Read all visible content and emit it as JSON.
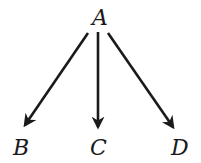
{
  "diagram": {
    "type": "tree",
    "colors": {
      "ink": "#1a1a1a",
      "background": "#ffffff"
    },
    "nodes": [
      {
        "id": "A",
        "label": "A"
      },
      {
        "id": "B",
        "label": "B"
      },
      {
        "id": "C",
        "label": "C"
      },
      {
        "id": "D",
        "label": "D"
      }
    ],
    "edges": [
      {
        "from": "A",
        "to": "B",
        "directed": true
      },
      {
        "from": "A",
        "to": "C",
        "directed": true
      },
      {
        "from": "A",
        "to": "D",
        "directed": true
      }
    ]
  }
}
